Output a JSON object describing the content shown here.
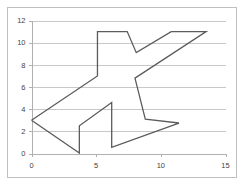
{
  "chart_data": {
    "type": "line",
    "title": "",
    "xlabel": "",
    "ylabel": "",
    "xlim": [
      0,
      15
    ],
    "ylim": [
      0,
      12
    ],
    "grid": true,
    "gridlines": "horizontal",
    "legend": "none",
    "series": [
      {
        "name": "shape",
        "closed": true,
        "color": "#5c5c5c",
        "points": [
          [
            0,
            3
          ],
          [
            5.1,
            7
          ],
          [
            5.1,
            11
          ],
          [
            7.4,
            11
          ],
          [
            8.1,
            9.1
          ],
          [
            10.8,
            11
          ],
          [
            13.5,
            11
          ],
          [
            8.0,
            6.8
          ],
          [
            8.8,
            3.1
          ],
          [
            11.4,
            2.75
          ],
          [
            6.2,
            0.55
          ],
          [
            6.2,
            4.6
          ],
          [
            3.7,
            2.5
          ],
          [
            3.7,
            0.05
          ],
          [
            0,
            3
          ]
        ]
      }
    ],
    "x_ticks": [
      {
        "value": 0,
        "label": "0"
      },
      {
        "value": 5,
        "label": "5"
      },
      {
        "value": 10,
        "label": "10"
      },
      {
        "value": 15,
        "label": "15"
      }
    ],
    "y_ticks": [
      {
        "value": 0,
        "label": "0"
      },
      {
        "value": 2,
        "label": "2"
      },
      {
        "value": 4,
        "label": "4"
      },
      {
        "value": 6,
        "label": "6"
      },
      {
        "value": 8,
        "label": "8"
      },
      {
        "value": 10,
        "label": "10"
      },
      {
        "value": 12,
        "label": "12"
      }
    ]
  },
  "colors": {
    "series": "#5c5c5c",
    "gridline": "#c8c8c8",
    "axis": "#b0b0b0",
    "frame_border": "#bfbfbf",
    "tick_text": "#3f3f3f",
    "background": "#ffffff"
  }
}
